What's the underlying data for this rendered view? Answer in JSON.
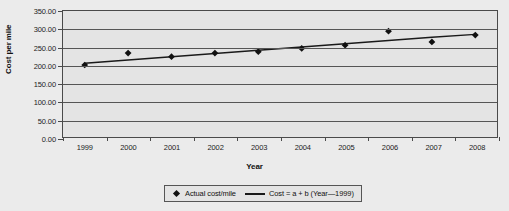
{
  "chart_data": {
    "type": "scatter",
    "title": "",
    "xlabel": "Year",
    "ylabel": "Cost per mile",
    "x": [
      1999,
      2000,
      2001,
      2002,
      2003,
      2004,
      2005,
      2006,
      2007,
      2008
    ],
    "categories": [
      "1999",
      "2000",
      "2001",
      "2002",
      "2003",
      "2004",
      "2005",
      "2006",
      "2007",
      "2008"
    ],
    "xtick_labels": [
      "1999",
      "2000",
      "2001",
      "2002",
      "2003",
      "2004",
      "2005",
      "2006",
      "2007",
      "2008"
    ],
    "ytick_labels": [
      "0.00",
      "50.00",
      "100.00",
      "150.00",
      "200.00",
      "250.00",
      "300.00",
      "350.00"
    ],
    "ytick_values": [
      0,
      50,
      100,
      150,
      200,
      250,
      300,
      350
    ],
    "ylim": [
      0,
      350
    ],
    "grid": "horizontal",
    "legend_position": "bottom-center",
    "series": [
      {
        "name": "Actual cost/mile",
        "type": "scatter",
        "marker": "diamond",
        "color": "#111111",
        "values": [
          200,
          233,
          223,
          233,
          237,
          246,
          255,
          294,
          264,
          283
        ]
      },
      {
        "name": "Cost = a + b (Year—1999)",
        "type": "line",
        "color": "#1a1a1a",
        "values": [
          205,
          214,
          223,
          232,
          241,
          250,
          259,
          268,
          277,
          285
        ]
      }
    ]
  },
  "axes": {
    "y_title": "Cost per mile",
    "x_title": "Year"
  },
  "legend": {
    "entries": [
      {
        "label": "Actual cost/mile",
        "marker": "diamond"
      },
      {
        "label": "Cost = a + b (Year—1999)",
        "marker": "line"
      }
    ]
  },
  "colors": {
    "page_background": "#ebebeb",
    "plot_background": "#e4e4e4",
    "gridline": "#555555",
    "frame": "#4a4a4a",
    "marker": "#111111",
    "trendline": "#1a1a1a",
    "text": "#111111"
  }
}
